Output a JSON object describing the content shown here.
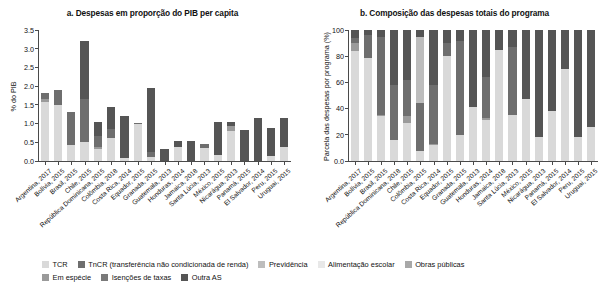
{
  "figure": {
    "panel_a_title": "a. Despesas em proporção do PIB per capita",
    "panel_b_title": "b. Composição das despesas totais do programa"
  },
  "legend": {
    "row1": [
      {
        "label": "TCR",
        "color": "#d9d9d9",
        "name": "legend-tcr"
      },
      {
        "label": "TnCR (transferência não condicionada de renda)",
        "color": "#6e6e6e",
        "name": "legend-tncr"
      },
      {
        "label": "Previdência",
        "color": "#bdbdbd",
        "name": "legend-previdencia"
      },
      {
        "label": "Alimentação escolar",
        "color": "#e8e8e8",
        "name": "legend-alimentacao-escolar"
      },
      {
        "label": "Obras públicas",
        "color": "#a8a8a8",
        "name": "legend-obras-publicas"
      }
    ],
    "row2": [
      {
        "label": "Em espécie",
        "color": "#9a9a9a",
        "name": "legend-em-especie"
      },
      {
        "label": "Isenções de taxas",
        "color": "#7a7a7a",
        "name": "legend-isencoes-de-taxas"
      },
      {
        "label": "Outra AS",
        "color": "#555555",
        "name": "legend-outra-as"
      }
    ]
  },
  "chart_data": [
    {
      "type": "bar",
      "stacked": true,
      "id": "panel-a",
      "title": "a. Despesas em proporção do PIB per capita",
      "xlabel": "",
      "ylabel": "% do PIB",
      "ylim": [
        0,
        3.5
      ],
      "yticks": [
        "0.0",
        "0.5",
        "1.0",
        "1.5",
        "2.0",
        "2.5",
        "3.0",
        "3.5"
      ],
      "grid": false,
      "legend_position": "bottom",
      "categories": [
        "Argentina, 2017",
        "Bolívia, 2015",
        "Brasil, 2015",
        "Chile, 2015",
        "República Dominicana, 2015",
        "Colômbia, 2018",
        "Costa Rica, 2014",
        "Equador, 2015",
        "Granada, 2015",
        "Guatemala, 2013",
        "Honduras, 2014",
        "Jamaica, 2018",
        "Santa Lúcia, 2013",
        "México, 2015",
        "Nicarágua, 2013",
        "Panamá, 2015",
        "El Salvador, 2014",
        "Peru, 2015",
        "Uruguai, 2015"
      ],
      "series": [
        {
          "name": "TCR",
          "color": "#d9d9d9",
          "values": [
            1.57,
            1.5,
            0.43,
            0.5,
            0.31,
            0.62,
            0.09,
            1.0,
            0.12,
            0.0,
            0.37,
            0.0,
            0.35,
            0.15,
            0.8,
            0.0,
            0.0,
            0.13,
            0.37
          ]
        },
        {
          "name": "Em espécie",
          "color": "#9a9a9a",
          "values": [
            0.09,
            0.0,
            0.0,
            0.0,
            0.07,
            0.0,
            0.0,
            0.0,
            0.0,
            0.0,
            0.0,
            0.0,
            0.0,
            0.0,
            0.14,
            0.0,
            0.0,
            0.0,
            0.0
          ]
        },
        {
          "name": "TnCR",
          "color": "#6e6e6e",
          "values": [
            0.16,
            0.4,
            0.87,
            1.17,
            0.3,
            0.23,
            0.0,
            0.02,
            0.12,
            0.0,
            0.0,
            0.0,
            0.1,
            0.0,
            0.0,
            0.0,
            0.0,
            0.0,
            0.0
          ]
        },
        {
          "name": "Outra AS",
          "color": "#555555",
          "values": [
            0.0,
            0.0,
            0.0,
            1.55,
            0.37,
            0.6,
            1.11,
            0.0,
            1.71,
            0.33,
            0.16,
            0.53,
            0.0,
            0.9,
            0.1,
            0.82,
            1.14,
            0.76,
            0.78
          ]
        }
      ],
      "totals": [
        1.82,
        1.9,
        1.3,
        3.22,
        1.05,
        1.45,
        1.2,
        1.02,
        1.95,
        0.33,
        0.53,
        0.53,
        0.45,
        1.05,
        1.04,
        0.82,
        1.14,
        0.89,
        1.15
      ]
    },
    {
      "type": "bar",
      "stacked": true,
      "id": "panel-b",
      "title": "b. Composição das despesas totais do programa",
      "xlabel": "",
      "ylabel": "Parcela das despesas por programa (%)",
      "ylim": [
        0,
        100
      ],
      "yticks": [
        "0.0",
        "20",
        "40",
        "60",
        "80",
        "100"
      ],
      "grid": false,
      "legend_position": "bottom",
      "categories": [
        "Argentina, 2017",
        "Bolívia, 2015",
        "Brasil, 2015",
        "República Dominicana, 2018",
        "Chile, 2015",
        "Colômbia, 2015",
        "Costa Rica, 2014",
        "Equador, 2015",
        "Granada, 2015",
        "Guatemala, 2013",
        "Honduras, 2014",
        "Jamaica, 2018",
        "Santa Lúcia, 2013",
        "México, 2015",
        "Nicarágua, 2013",
        "Panamá, 2015",
        "El Salvador, 2014",
        "Peru, 2015",
        "Uruguai, 2015"
      ],
      "series": [
        {
          "name": "TCR",
          "color": "#d9d9d9",
          "values": [
            84,
            79,
            34,
            16,
            29,
            8,
            12,
            80,
            20,
            41,
            31,
            85,
            35,
            47,
            18,
            38,
            70,
            18,
            26
          ]
        },
        {
          "name": "Em espécie",
          "color": "#9a9a9a",
          "values": [
            6,
            0,
            1.5,
            0,
            5.5,
            0,
            1,
            0,
            0,
            0.5,
            2,
            0,
            0,
            0,
            0,
            0,
            0,
            0,
            0
          ]
        },
        {
          "name": "TnCR",
          "color": "#6e6e6e",
          "values": [
            4,
            17,
            59,
            42,
            27,
            36,
            45,
            10,
            72,
            0,
            31,
            0,
            52,
            0,
            0,
            0,
            0,
            0,
            0
          ]
        },
        {
          "name": "Previdência",
          "color": "#bdbdbd",
          "values": [
            0,
            0,
            0,
            0,
            0,
            51,
            0,
            0,
            0,
            0,
            0,
            0,
            0,
            0,
            0,
            0,
            0,
            0,
            0
          ]
        },
        {
          "name": "Outra AS",
          "color": "#555555",
          "values": [
            6,
            4,
            5.5,
            42,
            38.5,
            5,
            42,
            10,
            8,
            58.5,
            36,
            15,
            13,
            53,
            82,
            62,
            30,
            82,
            74
          ]
        }
      ]
    }
  ]
}
